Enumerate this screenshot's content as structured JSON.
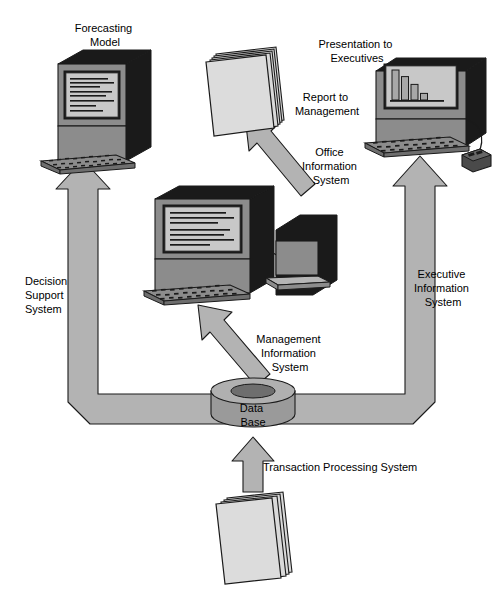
{
  "diagram": {
    "type": "flow-diagram",
    "background_color": "#ffffff",
    "palette": {
      "arrow_fill": "#b3b3b3",
      "arrow_stroke": "#1a1a1a",
      "device_dark": "#1a1a1a",
      "device_gray": "#8c8c8c",
      "device_light": "#b5b5b5",
      "screen_bg": "#c8c8c8",
      "paper_fill": "#d9d9d9",
      "db_fill": "#9a9a9a",
      "db_top": "#b0b0b0",
      "db_hole": "#6e6e6e",
      "text_color": "#000000"
    },
    "labels": {
      "forecasting_model": {
        "lines": [
          "Forecasting",
          "Model"
        ],
        "x": 105,
        "y": 32,
        "align": "middle"
      },
      "presentation_to_executives": {
        "lines": [
          "Presentation to",
          "Executives"
        ],
        "x": 357,
        "y": 48,
        "align": "middle"
      },
      "report_to_management": {
        "lines": [
          "Report to",
          "Management"
        ],
        "x": 327,
        "y": 101,
        "align": "middle"
      },
      "office_information_system": {
        "lines": [
          "Office",
          "Information",
          "System"
        ],
        "x": 331,
        "y": 156,
        "align": "middle"
      },
      "decision_support_system": {
        "lines": [
          "Decision",
          "Support",
          "System"
        ],
        "x": 25,
        "y": 285,
        "align": "start"
      },
      "executive_information_system": {
        "lines": [
          "Executive",
          "Information",
          "System"
        ],
        "x": 443,
        "y": 278,
        "align": "middle"
      },
      "management_information_system": {
        "lines": [
          "Management",
          "Information",
          "System"
        ],
        "x": 290,
        "y": 343,
        "align": "middle"
      },
      "data_base": {
        "lines": [
          "Data",
          "Base"
        ],
        "x": 253,
        "y": 412,
        "align": "middle"
      },
      "transaction_processing_system": {
        "lines": [
          "Transaction Processing System"
        ],
        "x": 263,
        "y": 471,
        "align": "start"
      }
    },
    "nodes": [
      {
        "name": "forecasting-model-computer",
        "kind": "computer-with-keyboard",
        "label_key": "forecasting_model"
      },
      {
        "name": "mis-computer",
        "kind": "computer-with-keyboard-and-printer",
        "label_key": "management_information_system"
      },
      {
        "name": "executive-computer",
        "kind": "computer-with-keyboard-and-mouse",
        "label_key": "presentation_to_executives",
        "screen_content": "bar-chart"
      },
      {
        "name": "report-document-stack",
        "kind": "paper-stack",
        "label_key": "report_to_management"
      },
      {
        "name": "transaction-document-stack",
        "kind": "paper-stack",
        "label_key": "transaction_processing_system"
      },
      {
        "name": "database-cylinder",
        "kind": "database",
        "label_key": "data_base"
      }
    ],
    "flows": [
      {
        "name": "flow-transaction-processing",
        "from": "transaction-document-stack",
        "to": "database-cylinder",
        "label_key": "transaction_processing_system",
        "direction": "up"
      },
      {
        "name": "flow-decision-support",
        "from": "database-cylinder",
        "to": "forecasting-model-computer",
        "label_key": "decision_support_system",
        "direction": "left-then-up"
      },
      {
        "name": "flow-management-information",
        "from": "database-cylinder",
        "to": "mis-computer",
        "label_key": "management_information_system",
        "direction": "up-left-diagonal"
      },
      {
        "name": "flow-office-information",
        "from": "mis-computer",
        "to": "report-document-stack",
        "label_key": "office_information_system",
        "direction": "up-left-diagonal"
      },
      {
        "name": "flow-executive-information",
        "from": "database-cylinder",
        "to": "executive-computer",
        "label_key": "executive_information_system",
        "direction": "right-then-up"
      }
    ],
    "chart_data": {
      "type": "bar",
      "title": "",
      "categories": [
        "1",
        "2",
        "3",
        "4"
      ],
      "values": [
        100,
        78,
        52,
        22
      ],
      "xlabel": "",
      "ylabel": "",
      "ylim": [
        0,
        100
      ],
      "grid": false,
      "legend": "none",
      "note": "Bar chart shown on the executive computer screen; four descending bars."
    },
    "screen_text_lines": {
      "forecasting_model_lines": 7,
      "mis_lines": 6
    }
  }
}
